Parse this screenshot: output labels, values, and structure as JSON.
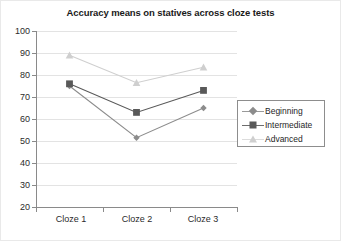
{
  "chart_data": {
    "type": "line",
    "title": "Accuracy means on statives across cloze tests",
    "xlabel": "",
    "ylabel": "",
    "categories": [
      "Cloze 1",
      "Cloze 2",
      "Cloze 3"
    ],
    "ylim": [
      20,
      100
    ],
    "yticks": [
      20,
      30,
      40,
      50,
      60,
      70,
      80,
      90,
      100
    ],
    "ytick_labels": [
      "20",
      "30",
      "40",
      "50",
      "60",
      "70",
      "80",
      "90",
      "100"
    ],
    "grid": true,
    "legend_position": "right",
    "series": [
      {
        "name": "Beginning",
        "marker": "diamond",
        "color": "#8c8c8c",
        "values": [
          75,
          51.5,
          65
        ]
      },
      {
        "name": "Intermediate",
        "marker": "square",
        "color": "#595959",
        "values": [
          76,
          63,
          73
        ]
      },
      {
        "name": "Advanced",
        "marker": "triangle",
        "color": "#cfcfcf",
        "values": [
          89,
          76.5,
          83.5
        ]
      }
    ]
  },
  "legend": {
    "items": [
      {
        "label": "Beginning"
      },
      {
        "label": "Intermediate"
      },
      {
        "label": "Advanced"
      }
    ]
  },
  "axis": {
    "y_labels": [
      "100",
      "90",
      "80",
      "70",
      "60",
      "50",
      "40",
      "30",
      "20"
    ],
    "x_labels": [
      "Cloze 1",
      "Cloze 2",
      "Cloze 3"
    ]
  }
}
